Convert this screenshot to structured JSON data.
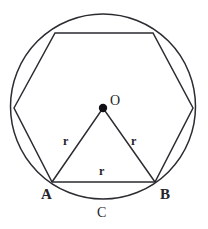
{
  "figure": {
    "stroke_color": "#2b2b31",
    "fill_color": "none",
    "background_color": "#ffffff",
    "point_color": "#111115",
    "width": 208,
    "height": 229
  },
  "circle": {
    "cx": 103,
    "cy": 106.5,
    "r": 92.5,
    "label": "circle"
  },
  "hexagon": {
    "name": "inscribed-regular-hexagon",
    "vertices": [
      {
        "id": "V1",
        "x": 14,
        "y": 108
      },
      {
        "id": "V2",
        "x": 55,
        "y": 33
      },
      {
        "id": "V3",
        "x": 153,
        "y": 33
      },
      {
        "id": "V4",
        "x": 193,
        "y": 108
      },
      {
        "id": "B",
        "x": 155,
        "y": 182
      },
      {
        "id": "A",
        "x": 52,
        "y": 182
      }
    ],
    "points_string": "14,108 55,33 153,33 193,108 155,182 52,182"
  },
  "center_point": {
    "x": 103,
    "y": 108,
    "dot_radius": 4.2
  },
  "triangle": {
    "name": "triangle-OAB",
    "points_string": "103,108 52,182 155,182"
  },
  "labels": {
    "center": {
      "text": "O",
      "x": 110,
      "y": 94
    },
    "vertex_a": {
      "text": "A",
      "x": 41,
      "y": 187
    },
    "vertex_b": {
      "text": "B",
      "x": 160,
      "y": 187
    },
    "arc_c": {
      "text": "C",
      "x": 97,
      "y": 206
    },
    "radius_left": {
      "text": "r",
      "x": 63,
      "y": 135
    },
    "radius_right": {
      "text": "r",
      "x": 131,
      "y": 135
    },
    "radius_base": {
      "text": "r",
      "x": 99,
      "y": 165
    }
  }
}
